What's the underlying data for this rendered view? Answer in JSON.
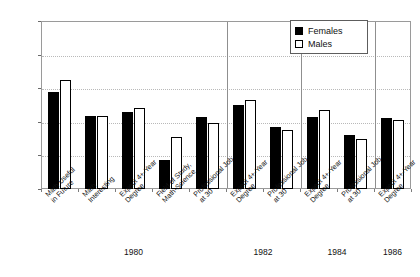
{
  "chart_data": {
    "type": "bar",
    "title": "",
    "xlabel": "",
    "ylabel": "",
    "ylim": [
      0,
      100
    ],
    "ytick_labels": [
      "0%",
      "20%",
      "40%",
      "60%",
      "80%",
      "100%"
    ],
    "ytick_values": [
      0,
      20,
      40,
      60,
      80,
      100
    ],
    "grid": true,
    "legend_position": "top-right",
    "categories": [
      "Math Useful\nin Future",
      "Math\nInteresting",
      "Expect 4+-Year\nDegree",
      "Field of Study,\nMath-Science",
      "Professional Job\nat 30",
      "Expect 4+-Year\nDegree",
      "Professional Job\nat 30",
      "Expect 4+-Year\nDegree",
      "Professional Job\nat 30",
      "Expect 4+-Year\nDegree"
    ],
    "groups": [
      {
        "year": "1980",
        "category_count": 5
      },
      {
        "year": "1982",
        "category_count": 2
      },
      {
        "year": "1984",
        "category_count": 2
      },
      {
        "year": "1986",
        "category_count": 1
      }
    ],
    "series": [
      {
        "name": "Females",
        "color": "#000000",
        "values": [
          58,
          43.5,
          46,
          17,
          43,
          50,
          37,
          43,
          32,
          42
        ]
      },
      {
        "name": "Males",
        "color": "#ffffff",
        "values": [
          65,
          43.5,
          48,
          31,
          39,
          53,
          35,
          47,
          30,
          41
        ]
      }
    ]
  },
  "legend": {
    "items": [
      {
        "label": "Females",
        "style": "filled"
      },
      {
        "label": "Males",
        "style": "outlined"
      }
    ]
  }
}
